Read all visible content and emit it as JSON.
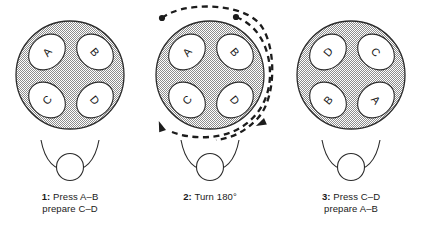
{
  "figure": {
    "panel_count": 3,
    "colors": {
      "outline": "#2b2b2b",
      "disc_fill_gray": "#b9b9b9",
      "pad_fill": "#ffffff",
      "letter_color": "#1a1a1a",
      "arrow_color": "#1c1c1c",
      "background": "#ffffff"
    }
  },
  "panels": [
    {
      "id": "panel-1",
      "step_number": "1:",
      "caption_line_1": "Press A–B",
      "caption_line_2": "prepare C–D",
      "caption_full": "1: Press A–B prepare C–D",
      "rotation_deg": 0,
      "has_rotation_arrows": false,
      "pads": [
        {
          "label": "A",
          "position": "top-left",
          "letter_rotation_deg": -50
        },
        {
          "label": "B",
          "position": "top-right",
          "letter_rotation_deg": 50
        },
        {
          "label": "C",
          "position": "bottom-left",
          "letter_rotation_deg": -130
        },
        {
          "label": "D",
          "position": "bottom-right",
          "letter_rotation_deg": 130
        }
      ]
    },
    {
      "id": "panel-2",
      "step_number": "2:",
      "caption_line_1": "Turn 180°",
      "caption_line_2": "",
      "caption_full": "2: Turn 180°",
      "rotation_deg": 180,
      "has_rotation_arrows": true,
      "arrows": {
        "count": 2,
        "style": "dashed",
        "direction": "clockwise",
        "tail_marker": "round-dot",
        "head_marker": "filled-triangle"
      },
      "pads": [
        {
          "label": "A",
          "position": "top-left",
          "letter_rotation_deg": -50
        },
        {
          "label": "B",
          "position": "top-right",
          "letter_rotation_deg": 50
        },
        {
          "label": "C",
          "position": "bottom-left",
          "letter_rotation_deg": -130
        },
        {
          "label": "D",
          "position": "bottom-right",
          "letter_rotation_deg": 130
        }
      ]
    },
    {
      "id": "panel-3",
      "step_number": "3:",
      "caption_line_1": "Press C–D",
      "caption_line_2": "prepare A–B",
      "caption_full": "3: Press C–D prepare A–B",
      "rotation_deg": 180,
      "has_rotation_arrows": false,
      "pads": [
        {
          "label": "D",
          "position": "top-left",
          "letter_rotation_deg": -50
        },
        {
          "label": "C",
          "position": "top-right",
          "letter_rotation_deg": 50
        },
        {
          "label": "B",
          "position": "bottom-left",
          "letter_rotation_deg": -130
        },
        {
          "label": "A",
          "position": "bottom-right",
          "letter_rotation_deg": 130
        }
      ]
    }
  ]
}
